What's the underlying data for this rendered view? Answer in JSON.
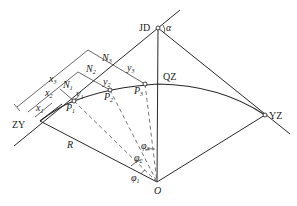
{
  "diagram": {
    "type": "circular-curve-offset-layout",
    "colors": {
      "line": "#2a2a2a",
      "dashed": "#555555",
      "background": "#ffffff"
    },
    "points": {
      "JD": {
        "label": "JD",
        "x": 158,
        "y": 28
      },
      "ZY": {
        "label": "ZY",
        "x": 40,
        "y": 121
      },
      "QZ": {
        "label": "QZ",
        "x": 158,
        "y": 84
      },
      "YZ": {
        "label": "YZ",
        "x": 265,
        "y": 115
      },
      "O": {
        "label": "O",
        "x": 157,
        "y": 182
      },
      "P1": {
        "label": "P",
        "sub": "1",
        "x": 74,
        "y": 101
      },
      "P2": {
        "label": "P",
        "sub": "2",
        "x": 110,
        "y": 90
      },
      "P3": {
        "label": "P",
        "sub": "3",
        "x": 145,
        "y": 84
      }
    },
    "labels": {
      "alpha": "α",
      "R": "R",
      "N": "N",
      "x": "x",
      "y": "y",
      "phi": "φ",
      "s1": "1",
      "s2": "2",
      "s3": "3"
    }
  }
}
